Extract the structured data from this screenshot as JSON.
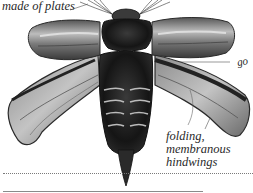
{
  "page": {
    "type": "book-illustration"
  },
  "labels": {
    "plates": "made of plates",
    "go": "go",
    "hindwings_line1": "folding,",
    "hindwings_line2": "membranous",
    "hindwings_line3": "hindwings"
  },
  "colors": {
    "background": "#ffffff",
    "ink": "#2a2a2a",
    "beetle_dark": "#1a1a1a",
    "elytra": "#6a6a6a",
    "wing_membrane": "#a8a8a8"
  }
}
